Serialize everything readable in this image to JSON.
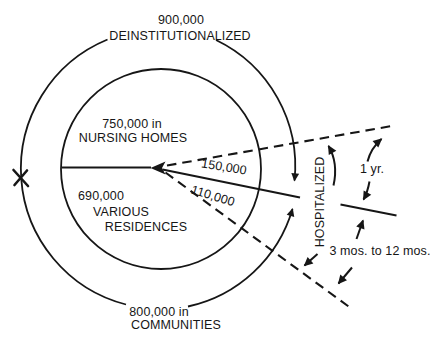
{
  "diagram": {
    "top_label": {
      "value": "900,000",
      "caption": "DEINSTITUTIONALIZED"
    },
    "nursing_homes": {
      "line1": "750,000 in",
      "line2": "NURSING HOMES"
    },
    "various_residences": {
      "line1": "690,000",
      "line2": "VARIOUS",
      "line3": "RESIDENCES"
    },
    "communities": {
      "line1": "800,000 in",
      "line2": "COMMUNITIES"
    },
    "flows": {
      "upper_value": "150,000",
      "lower_value": "110,000"
    },
    "hospitalized_label": "HOSPITALIZED",
    "durations": {
      "one_year": "1 yr.",
      "range": "3 mos. to 12 mos."
    },
    "colors": {
      "ink": "#161616",
      "background": "#ffffff"
    }
  }
}
